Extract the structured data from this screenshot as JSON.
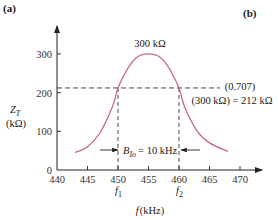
{
  "panel_labels": {
    "left": "(a)",
    "right": "(b)"
  },
  "chart_data": {
    "type": "line",
    "title": "",
    "xlabel": "f (kHz)",
    "ylabel": "Z_T (kΩ)",
    "ylabel_main": "Z",
    "ylabel_sub": "T",
    "ylabel_unit": "(kΩ)",
    "xlabel_var": "f",
    "xlabel_unit": "(kHz)",
    "xlim": [
      440,
      473
    ],
    "ylim": [
      0,
      370
    ],
    "x_ticks": [
      440,
      445,
      450,
      455,
      460,
      465,
      470
    ],
    "y_ticks": [
      0,
      100,
      200,
      300
    ],
    "grid": false,
    "series": [
      {
        "name": "Z_T",
        "color": "#c46a82",
        "x": [
          443,
          445,
          447,
          449,
          450,
          451,
          452,
          453,
          454,
          455,
          456,
          457,
          458,
          459,
          460,
          461,
          463,
          465,
          468
        ],
        "y": [
          45,
          60,
          95,
          160,
          212,
          245,
          272,
          290,
          298,
          300,
          298,
          290,
          272,
          245,
          212,
          160,
          100,
          70,
          48
        ]
      }
    ],
    "reference_line": {
      "y": 212,
      "style": "dashed",
      "x_range": [
        440,
        470
      ]
    },
    "vertical_lines": [
      {
        "x": 450,
        "label": "f1",
        "label_main": "f",
        "label_sub": "1"
      },
      {
        "x": 460,
        "label": "f2",
        "label_main": "f",
        "label_sub": "2"
      }
    ],
    "annotations": {
      "peak": "300 kΩ",
      "half_power_line1": "(0.707)",
      "half_power_line2": "(300 kΩ) = 212 kΩ",
      "bandwidth_main": "B",
      "bandwidth_sub": "Ιο",
      "bandwidth_value": "= 10 kHz"
    }
  }
}
